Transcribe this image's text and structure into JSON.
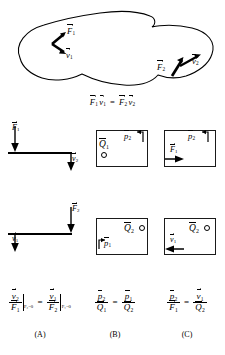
{
  "figure": {
    "caption_equation": "F⃗1·v⃗1 = F⃗2·v⃗2",
    "panels": [
      "(A)",
      "(B)",
      "(C)"
    ]
  },
  "blob": {
    "name": "arbitrary-elastic-body",
    "vectors": [
      {
        "id": "F1",
        "letter": "F",
        "sub": "1",
        "accent": "vector",
        "direction": "up-right",
        "x": 68,
        "y": 32
      },
      {
        "id": "v1",
        "letter": "v",
        "sub": "1",
        "accent": "vector",
        "direction": "down-right",
        "x": 68,
        "y": 50
      },
      {
        "id": "F2",
        "letter": "F",
        "sub": "2",
        "accent": "vector",
        "direction": "up-right",
        "x": 162,
        "y": 66
      },
      {
        "id": "v2",
        "letter": "v",
        "sub": "2",
        "accent": "vector",
        "direction": "up-right",
        "x": 190,
        "y": 59
      }
    ],
    "equation": {
      "left_force": "F",
      "left_force_sub": "1",
      "left_vel": "v",
      "left_vel_sub": "1",
      "relation": "=",
      "right_force": "F",
      "right_force_sub": "2",
      "right_vel": "v",
      "right_vel_sub": "2"
    }
  },
  "row1": {
    "panelA": {
      "name": "lever-force-F1-response-v2",
      "applied": {
        "letter": "F",
        "sub": "1",
        "accent": "vector",
        "arrow": "down",
        "side": "left"
      },
      "response": {
        "letter": "v",
        "sub": "2",
        "accent": "vector",
        "arrow": "down",
        "side": "right"
      }
    },
    "panelB": {
      "name": "fluid-box-source-Q1-pressure-p2",
      "source": {
        "letter": "Q",
        "sub": "1",
        "accent": "bar",
        "marker": "circle",
        "position": "bottom-left"
      },
      "measure": {
        "letter": "p",
        "sub": "2",
        "accent": "bar",
        "marker": "port",
        "position": "top-right"
      }
    },
    "panelC": {
      "name": "mixed-box-force-F1-pressure-p2",
      "applied": {
        "letter": "F",
        "sub": "1",
        "accent": "vector",
        "arrow": "right",
        "position": "bottom-left"
      },
      "measure": {
        "letter": "p",
        "sub": "2",
        "accent": "bar",
        "marker": "port",
        "position": "top-right"
      }
    }
  },
  "row2": {
    "panelA": {
      "name": "lever-force-F2-response-v1",
      "applied": {
        "letter": "F",
        "sub": "2",
        "accent": "vector",
        "arrow": "down",
        "side": "right"
      },
      "response": {
        "letter": "v",
        "sub": "1",
        "accent": "vector",
        "arrow": "down",
        "side": "left"
      }
    },
    "panelB": {
      "name": "fluid-box-source-Q2-pressure-p1",
      "source": {
        "letter": "Q",
        "sub": "2",
        "accent": "bar",
        "marker": "circle",
        "position": "top-right"
      },
      "measure": {
        "letter": "p",
        "sub": "1",
        "accent": "bar",
        "marker": "port",
        "position": "bottom-left"
      }
    },
    "panelC": {
      "name": "mixed-box-velocity-v1-source-Q2",
      "source": {
        "letter": "Q",
        "sub": "2",
        "accent": "bar",
        "marker": "circle",
        "position": "top-right"
      },
      "measure": {
        "letter": "v",
        "sub": "1",
        "accent": "vector",
        "arrow": "left",
        "position": "bottom-left"
      }
    }
  },
  "equations": {
    "A": {
      "lhs_num_letter": "v",
      "lhs_num_sub": "2",
      "lhs_den_letter": "F",
      "lhs_den_sub": "1",
      "lhs_cond": "F₂=0",
      "relation": "=",
      "rhs_num_letter": "v",
      "rhs_num_sub": "1",
      "rhs_den_letter": "F",
      "rhs_den_sub": "2",
      "rhs_cond": "F₁=0"
    },
    "B": {
      "lhs_num_letter": "p",
      "lhs_num_sub": "2",
      "lhs_den_letter": "Q",
      "lhs_den_sub": "1",
      "relation": "=",
      "rhs_num_letter": "p",
      "rhs_num_sub": "1",
      "rhs_den_letter": "Q",
      "rhs_den_sub": "2"
    },
    "C": {
      "lhs_num_letter": "p",
      "lhs_num_sub": "2",
      "lhs_den_letter": "F",
      "lhs_den_sub": "1",
      "relation": "=",
      "rhs_num_letter": "v",
      "rhs_num_sub": "1",
      "rhs_den_letter": "Q",
      "rhs_den_sub": "2"
    }
  }
}
